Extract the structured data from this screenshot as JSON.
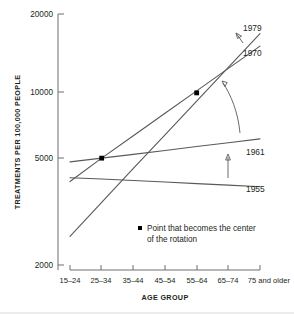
{
  "chart_data": {
    "type": "line",
    "title": "",
    "xlabel": "AGE GROUP",
    "ylabel": "TREATMENTS PER 100,000 PEOPLE",
    "yscale": "log",
    "ylim": [
      2000,
      20000
    ],
    "yticks": [
      "2000",
      "5000",
      "10000",
      "20000"
    ],
    "categories": [
      "15–24",
      "25–34",
      "35–44",
      "45–54",
      "55–64",
      "65–74",
      "75 and older"
    ],
    "grid": false,
    "legend_position": "inside-bottom-center",
    "series": [
      {
        "name": "1955",
        "label": "1955",
        "values": [
          4450,
          4400,
          4340,
          4280,
          4220,
          4160,
          4100
        ]
      },
      {
        "name": "1961",
        "label": "1961",
        "values": [
          5150,
          5330,
          5520,
          5720,
          5930,
          6140,
          6360
        ]
      },
      {
        "name": "1970",
        "label": "1970",
        "values": [
          4300,
          5330,
          6550,
          8050,
          9880,
          12150,
          14900
        ]
      },
      {
        "name": "1979",
        "label": "1979",
        "values": [
          2600,
          3550,
          4850,
          6600,
          9000,
          12250,
          16700
        ]
      }
    ],
    "markers": [
      {
        "label": "rotation-center-lower",
        "x_category": "25–34",
        "value": 5330
      },
      {
        "label": "rotation-center-upper",
        "x_category": "55–64",
        "value": 9700
      }
    ],
    "annotations": [
      {
        "name": "rotation-arrow-upper",
        "type": "arrow",
        "direction": "up-left"
      },
      {
        "name": "rotation-arrow-curved",
        "type": "curved-arrow",
        "direction": "up-left"
      },
      {
        "name": "shift-arrow-lower",
        "type": "arrow",
        "direction": "up"
      }
    ]
  },
  "legend": {
    "marker": "square-dot",
    "line1": "Point that becomes the center",
    "line2": "of the rotation"
  }
}
